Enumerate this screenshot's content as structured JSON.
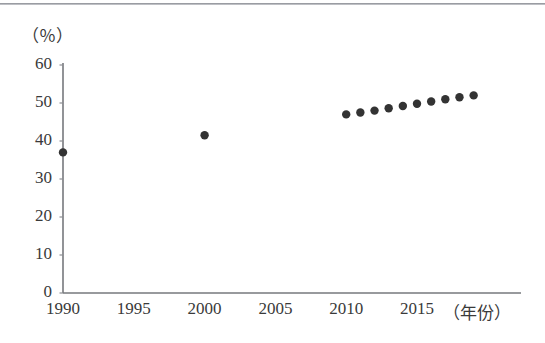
{
  "chart_data": {
    "type": "scatter",
    "title": "",
    "subtitle": "",
    "xlabel": "（年份）",
    "ylabel": "（％）",
    "xlim": [
      1990,
      2021
    ],
    "ylim": [
      0,
      60
    ],
    "grid": false,
    "legend": null,
    "x_ticks": [
      "1990",
      "1995",
      "2000",
      "2005",
      "2010",
      "2015"
    ],
    "x_tick_values": [
      1990,
      1995,
      2000,
      2005,
      2010,
      2015
    ],
    "y_ticks": [
      "0",
      "10",
      "20",
      "30",
      "40",
      "50",
      "60"
    ],
    "y_tick_values": [
      0,
      10,
      20,
      30,
      40,
      50,
      60
    ],
    "series": [
      {
        "name": "比例",
        "marker": "filled-circle",
        "color": "#333333",
        "points": [
          {
            "x": 1990,
            "y": 37.0
          },
          {
            "x": 2000,
            "y": 41.5
          },
          {
            "x": 2010,
            "y": 47.0
          },
          {
            "x": 2011,
            "y": 47.5
          },
          {
            "x": 2012,
            "y": 48.0
          },
          {
            "x": 2013,
            "y": 48.6
          },
          {
            "x": 2014,
            "y": 49.2
          },
          {
            "x": 2015,
            "y": 49.8
          },
          {
            "x": 2016,
            "y": 50.4
          },
          {
            "x": 2017,
            "y": 51.0
          },
          {
            "x": 2018,
            "y": 51.5
          },
          {
            "x": 2019,
            "y": 52.0
          }
        ]
      }
    ]
  },
  "figure": {
    "axis_color": "#6f7176",
    "marker_color": "#333333",
    "background": "#ffffff",
    "top_rule_color": "#8d8f95"
  }
}
